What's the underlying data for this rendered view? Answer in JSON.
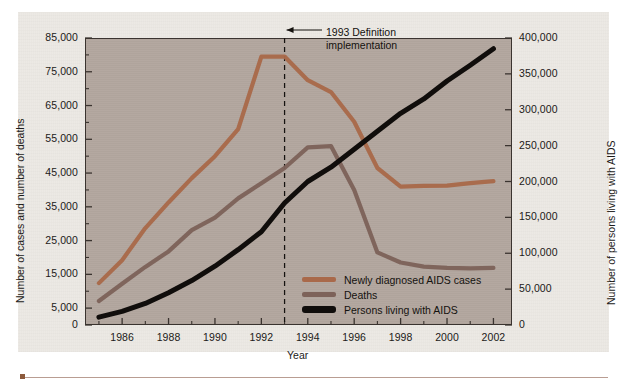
{
  "chart_data": {
    "type": "line",
    "title": "",
    "xlabel": "Year",
    "ylabel_left": "Number of cases and number of deaths",
    "ylabel_right": "Number of persons living with AIDS",
    "grid": false,
    "legend_position": "inside-bottom-right",
    "x": [
      1985,
      1986,
      1987,
      1988,
      1989,
      1990,
      1991,
      1992,
      1993,
      1994,
      1995,
      1996,
      1997,
      1998,
      1999,
      2000,
      2001,
      2002
    ],
    "xlim": [
      1984.4,
      2002.8
    ],
    "xticks_major": [
      1986,
      1988,
      1990,
      1992,
      1994,
      1996,
      1998,
      2000,
      2002
    ],
    "xticks_minor": [
      1985,
      1987,
      1989,
      1991,
      1993,
      1995,
      1997,
      1999,
      2001
    ],
    "ylim_left": [
      0,
      85000
    ],
    "yticks_left": [
      0,
      5000,
      15000,
      25000,
      35000,
      45000,
      55000,
      65000,
      75000,
      85000
    ],
    "yticklabels_left": [
      "0",
      "5,000",
      "15,000",
      "25,000",
      "35,000",
      "45,000",
      "55,000",
      "65,000",
      "75,000",
      "85,000"
    ],
    "ylim_right": [
      0,
      400000
    ],
    "yticks_right": [
      0,
      50000,
      100000,
      150000,
      200000,
      250000,
      300000,
      350000,
      400000
    ],
    "yticklabels_right": [
      "0",
      "50,000",
      "100,000",
      "150,000",
      "200,000",
      "250,000",
      "300,000",
      "350,000",
      "400,000"
    ],
    "annotations": [
      {
        "name": "definition-change",
        "text_line1": "1993 Definition",
        "text_line2": "implementation",
        "at_x": 1993,
        "style": "vertical-dashed-line-with-arrow"
      }
    ],
    "series": [
      {
        "name": "Newly diagnosed AIDS cases",
        "axis": "left",
        "color": "#a9694a",
        "values": [
          12400,
          19200,
          28700,
          36300,
          43500,
          50000,
          58000,
          79500,
          79500,
          72500,
          69000,
          60200,
          46500,
          41000,
          41200,
          41300,
          42000,
          42600
        ]
      },
      {
        "name": "Deaths",
        "axis": "left",
        "color": "#7d6259",
        "values": [
          7100,
          12200,
          17200,
          21800,
          28100,
          31800,
          37500,
          42000,
          46500,
          52600,
          53000,
          40000,
          21500,
          18500,
          17300,
          16900,
          16800,
          16900
        ]
      },
      {
        "name": "Persons living with AIDS",
        "axis": "right",
        "color": "#100d0b",
        "values": [
          11000,
          19000,
          30000,
          45000,
          62000,
          82000,
          105000,
          130000,
          170000,
          200000,
          220000,
          245000,
          270000,
          295000,
          315000,
          340000,
          362000,
          385000
        ]
      }
    ]
  },
  "legend": {
    "items": [
      {
        "label": "Newly diagnosed AIDS cases",
        "color": "#a9694a"
      },
      {
        "label": "Deaths",
        "color": "#7d6259"
      },
      {
        "label": "Persons living with AIDS",
        "color": "#100d0b"
      }
    ]
  },
  "axes": {
    "x_title": "Year",
    "y_left_title": "Number of cases and number of deaths",
    "y_right_title": "Number of persons living with AIDS"
  },
  "annotation": {
    "line1": "1993 Definition",
    "line2": "implementation"
  },
  "colors": {
    "cases": "#a9694a",
    "deaths": "#7d6259",
    "living": "#100d0b",
    "plot_background": "#b3a79f",
    "page_background": "#ece9e4",
    "axis": "#3a332f",
    "rule": "#b99d92"
  }
}
